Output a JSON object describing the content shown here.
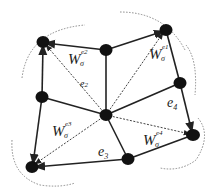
{
  "diagram": {
    "type": "graph",
    "colors": {
      "node": "#111111",
      "edge": "#222222",
      "dotted": "#555555",
      "arc": "#888888"
    },
    "nodes": [
      {
        "id": "A",
        "x": 43,
        "y": 42
      },
      {
        "id": "B",
        "x": 106,
        "y": 50
      },
      {
        "id": "C",
        "x": 166,
        "y": 30
      },
      {
        "id": "D",
        "x": 180,
        "y": 83
      },
      {
        "id": "E",
        "x": 193,
        "y": 135
      },
      {
        "id": "F",
        "x": 128,
        "y": 159
      },
      {
        "id": "G",
        "x": 32,
        "y": 167
      },
      {
        "id": "H",
        "x": 42,
        "y": 97
      },
      {
        "id": "O",
        "x": 106,
        "y": 115
      }
    ],
    "labels": {
      "w1": {
        "base": "W",
        "sub": "σ",
        "sup": "e1"
      },
      "w2": {
        "base": "W",
        "sub": "σ",
        "sup": "e2"
      },
      "w3": {
        "base": "W",
        "sub": "σ",
        "sup": "e3"
      },
      "w4": {
        "base": "W",
        "sub": "σ",
        "sup": "e4"
      },
      "e2": {
        "base": "e",
        "sub": "2"
      },
      "e3": {
        "base": "e",
        "sub": "3"
      },
      "e4": {
        "base": "e",
        "sub": "4"
      }
    }
  }
}
